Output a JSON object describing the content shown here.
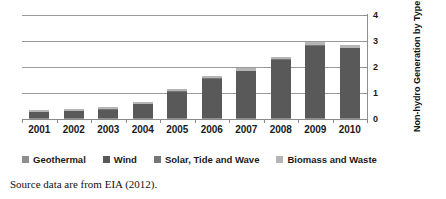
{
  "chart_data": {
    "type": "bar",
    "subtype": "stacked-bar",
    "title": "",
    "xlabel": "",
    "ylabel": "Non-hydro Generation by Type (Billion kWh)",
    "ylim": [
      0,
      4
    ],
    "yticks": [
      "0",
      "1",
      "2",
      "3",
      "4"
    ],
    "ytick_values": [
      0,
      1,
      2,
      3,
      4
    ],
    "grid": true,
    "axis_position": "right",
    "legend_position": "bottom",
    "categories": [
      "2001",
      "2002",
      "2003",
      "2004",
      "2005",
      "2006",
      "2007",
      "2008",
      "2009",
      "2010"
    ],
    "series": [
      {
        "name": "Geothermal",
        "color": "#8f8f8f",
        "values": [
          0.04,
          0.04,
          0.04,
          0.04,
          0.04,
          0.04,
          0.04,
          0.04,
          0.04,
          0.04
        ]
      },
      {
        "name": "Wind",
        "color": "#595959",
        "values": [
          0.22,
          0.26,
          0.32,
          0.52,
          1.0,
          1.5,
          1.8,
          2.22,
          2.78,
          2.68
        ]
      },
      {
        "name": "Solar, Tide and Wave",
        "color": "#767676",
        "values": [
          0.02,
          0.02,
          0.02,
          0.02,
          0.02,
          0.02,
          0.02,
          0.03,
          0.03,
          0.03
        ]
      },
      {
        "name": "Biomass and Waste",
        "color": "#b5b5b5",
        "values": [
          0.07,
          0.08,
          0.07,
          0.07,
          0.09,
          0.08,
          0.09,
          0.11,
          0.1,
          0.1
        ]
      }
    ],
    "totals": [
      0.35,
      0.4,
      0.45,
      0.65,
      1.15,
      1.64,
      1.95,
      2.4,
      2.95,
      2.85
    ]
  },
  "legend": {
    "items": [
      {
        "label": "Geothermal",
        "color": "#8f8f8f"
      },
      {
        "label": "Wind",
        "color": "#595959"
      },
      {
        "label": "Solar, Tide and Wave",
        "color": "#767676"
      },
      {
        "label": "Biomass and Waste",
        "color": "#b5b5b5"
      }
    ]
  },
  "caption": {
    "text": "Source data are from EIA (2012)."
  }
}
